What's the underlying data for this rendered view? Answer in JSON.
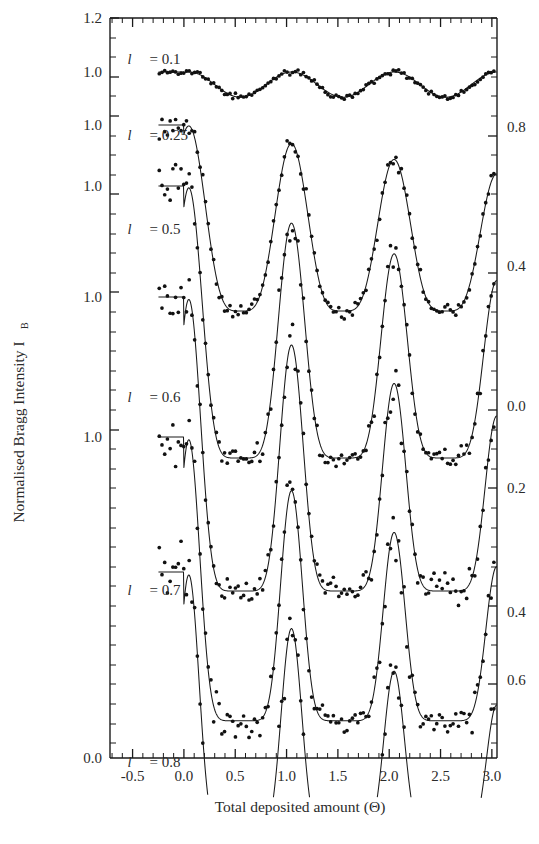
{
  "figure": {
    "xlabel": "Total deposited amount  (Θ)",
    "ylabel": "Normalised Bragg Intensity I",
    "ylabel_sub": "B",
    "background": "#ffffff",
    "ink": "#1a1a1a"
  },
  "axes": {
    "x_ticks_major": [
      "-0.5",
      "0.0",
      "0.5",
      "1.0",
      "1.5",
      "2.0",
      "2.5",
      "3.0"
    ],
    "x_tick_values": [
      -0.5,
      0.0,
      0.5,
      1.0,
      1.5,
      2.0,
      2.5,
      3.0
    ],
    "x_minor_per_major": 5,
    "xlim": [
      -0.72,
      3.05
    ],
    "left_labels": [
      "1.2",
      "1.0",
      "1.0",
      "1.0",
      "1.0",
      "1.0",
      "0.0"
    ],
    "left_label_y": [
      18,
      72,
      125,
      186,
      297,
      437,
      758
    ],
    "right_labels": [
      "0.8",
      "0.4",
      "0.0",
      "0.2",
      "0.4",
      "0.6"
    ],
    "right_label_y": [
      127,
      266,
      406,
      488,
      612,
      680
    ]
  },
  "chart_data": {
    "type": "line",
    "title": "",
    "xlabel": "Total deposited amount (Θ)",
    "ylabel": "Normalised Bragg Intensity I_B",
    "xlim": [
      -0.72,
      3.05
    ],
    "ylim": [
      0.0,
      1.2
    ],
    "grid": false,
    "legend": "inline-annotations",
    "x_ticks": [
      -0.5,
      0.0,
      0.5,
      1.0,
      1.5,
      2.0,
      2.5,
      3.0
    ],
    "left_axis_ticks": [
      "1.2",
      "1.0",
      "1.0",
      "1.0",
      "1.0",
      "1.0",
      "0.0"
    ],
    "right_axis_ticks": [
      "0.8",
      "0.4",
      "0.0",
      "0.2",
      "0.4",
      "0.6"
    ],
    "series": [
      {
        "name": "l = 0.1",
        "label": "l",
        "value": "0.1",
        "annotation_xy": [
          0.0,
          1.04
        ],
        "baseline": 1.0,
        "period": 1.0,
        "peak_theta": [
          1.05,
          2.08
        ],
        "trough_theta": [
          0.55,
          1.58,
          2.6
        ],
        "amplitude": 0.12,
        "sharpness": 1.0,
        "damping": 0.0,
        "offset_px": 72,
        "scale_px": 210
      },
      {
        "name": "l = 0.25",
        "label": "l",
        "value": "0.25",
        "annotation_xy": [
          0.0,
          0.95
        ],
        "baseline": 1.0,
        "period": 1.0,
        "peak_theta": [
          1.05,
          2.08
        ],
        "trough_theta": [
          0.55,
          1.58,
          2.6
        ],
        "amplitude": 0.62,
        "sharpness": 2.1,
        "damping": 0.1,
        "offset_px": 125,
        "scale_px": 300
      },
      {
        "name": "l = 0.5",
        "label": "l",
        "value": "0.5",
        "annotation_xy": [
          0.0,
          0.86
        ],
        "baseline": 1.0,
        "period": 1.0,
        "peak_theta": [
          1.05,
          2.08
        ],
        "trough_theta": [
          0.55,
          1.58,
          2.6
        ],
        "amplitude": 0.8,
        "sharpness": 3.2,
        "damping": 0.14,
        "offset_px": 186,
        "scale_px": 340
      },
      {
        "name": "l = 0.6",
        "label": "l",
        "value": "0.6",
        "annotation_xy": [
          0.0,
          0.7
        ],
        "baseline": 1.0,
        "period": 1.0,
        "peak_theta": [
          1.05,
          2.08
        ],
        "trough_theta": [
          0.55,
          1.58,
          2.6
        ],
        "amplitude": 0.84,
        "sharpness": 4.0,
        "damping": 0.17,
        "offset_px": 297,
        "scale_px": 350
      },
      {
        "name": "l = 0.7",
        "label": "l",
        "value": "0.7",
        "annotation_xy": [
          0.0,
          0.52
        ],
        "baseline": 1.0,
        "period": 1.0,
        "peak_theta": [
          1.05,
          2.08
        ],
        "trough_theta": [
          0.55,
          1.58,
          2.6
        ],
        "amplitude": 0.86,
        "sharpness": 4.6,
        "damping": 0.2,
        "offset_px": 437,
        "scale_px": 330
      },
      {
        "name": "l = 0.8",
        "label": "l",
        "value": "0.8",
        "annotation_xy": [
          0.0,
          0.35
        ],
        "baseline": 1.0,
        "period": 1.0,
        "peak_theta": [
          1.05,
          2.08
        ],
        "trough_theta": [
          0.55,
          1.58,
          2.6
        ],
        "amplitude": 0.88,
        "sharpness": 5.2,
        "damping": 0.23,
        "offset_px": 572,
        "scale_px": 300
      }
    ]
  }
}
